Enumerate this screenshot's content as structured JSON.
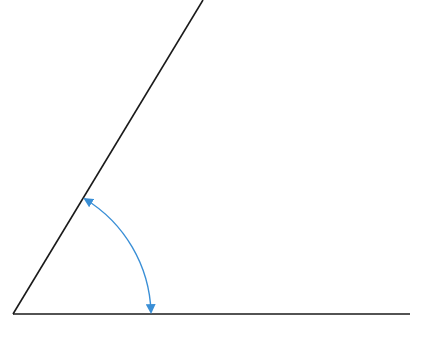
{
  "diagram": {
    "type": "angle",
    "vertex": [
      13,
      314
    ],
    "rays": [
      {
        "name": "slanted-ray",
        "from": [
          13,
          314
        ],
        "to": [
          203,
          0
        ]
      },
      {
        "name": "base-ray",
        "from": [
          13,
          314
        ],
        "to": [
          410,
          314
        ]
      }
    ],
    "arc": {
      "from": [
        84,
        198
      ],
      "to": [
        151,
        313
      ],
      "bidirectional": true
    },
    "colors": {
      "line": "#1a1a1a",
      "arc": "#3a8fd6",
      "background": "#ffffff"
    }
  }
}
